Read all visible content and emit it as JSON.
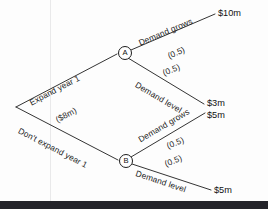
{
  "diagram": {
    "type": "decision-tree",
    "background_color": "#fdfdfd",
    "line_color": "#1d1d1d",
    "nodes": [
      {
        "id": "root",
        "label": "",
        "shape": "vertex",
        "x": 16,
        "y": 107
      },
      {
        "id": "A",
        "label": "A",
        "shape": "circle",
        "x": 124,
        "y": 52
      },
      {
        "id": "B",
        "label": "B",
        "shape": "circle",
        "x": 125,
        "y": 160
      }
    ],
    "branches": {
      "expand": {
        "label": "Expand year 1",
        "cost": "($8m)"
      },
      "dont_expand": {
        "label": "Don't expand year 1",
        "cost": ""
      },
      "a_grows": {
        "label": "Demand grows",
        "probability": "(0.5)",
        "payoff": "$10m"
      },
      "a_level": {
        "label": "Demand level",
        "probability": "(0.5)",
        "payoff": "$3m"
      },
      "b_grows": {
        "label": "Demand grows",
        "probability": "(0.5)",
        "payoff": "$5m"
      },
      "b_level": {
        "label": "Demand level",
        "probability": "(0.5)",
        "payoff": "$5m"
      }
    }
  }
}
